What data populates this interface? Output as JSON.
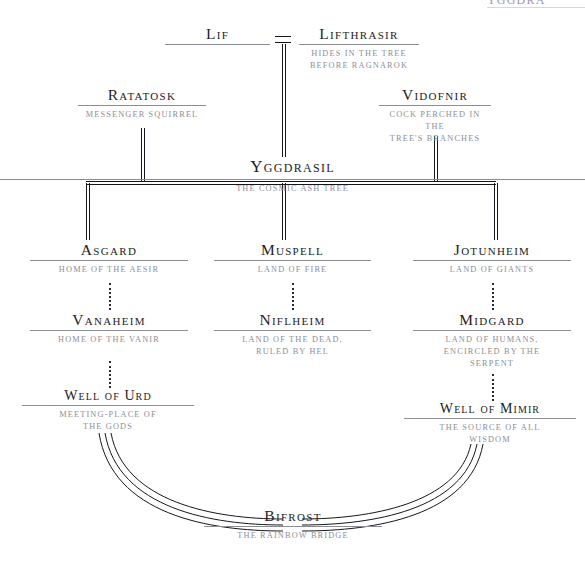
{
  "top_artifact": {
    "text": "YGGDRA"
  },
  "nodes": {
    "lif": {
      "title": "Lif",
      "desc": ""
    },
    "lifthrasir": {
      "title": "Lifthrasir",
      "desc": "HIDES IN THE TREE\nBEFORE RAGNAROK"
    },
    "ratatosk": {
      "title": "Ratatosk",
      "desc": "MESSENGER SQUIRREL"
    },
    "vidofnir": {
      "title": "Vidofnir",
      "desc": "COCK PERCHED IN THE\nTREE'S BRANCHES"
    },
    "yggdrasil": {
      "title": "Yggdrasil",
      "desc": "THE COSMIC ASH TREE"
    },
    "asgard": {
      "title": "Asgard",
      "desc": "HOME OF THE AESIR"
    },
    "vanaheim": {
      "title": "Vanaheim",
      "desc": "HOME OF THE VANIR"
    },
    "well_of_urd": {
      "title": "Well of Urd",
      "desc": "MEETING-PLACE OF\nTHE GODS"
    },
    "muspell": {
      "title": "Muspell",
      "desc": "LAND OF FIRE"
    },
    "niflheim": {
      "title": "Niflheim",
      "desc": "LAND OF THE DEAD,\nRULED BY HEL"
    },
    "jotunheim": {
      "title": "Jotunheim",
      "desc": "LAND OF GIANTS"
    },
    "midgard": {
      "title": "Midgard",
      "desc": "LAND OF HUMANS,\nENCIRCLED BY THE\nSERPENT"
    },
    "well_of_mimir": {
      "title": "Well of Mimir",
      "desc": "THE SOURCE OF ALL\nWISDOM"
    },
    "bifrost": {
      "title": "Bifrost",
      "desc": "THE RAINBOW BRIDGE"
    }
  },
  "colors": {
    "ink": "#1d1d25",
    "rule": "#8c8c94",
    "desc": "#8e8e96",
    "line": "#16161c",
    "background": "#ffffff"
  }
}
